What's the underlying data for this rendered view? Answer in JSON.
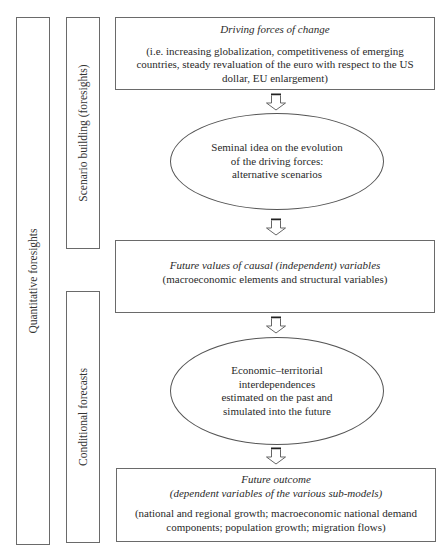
{
  "sections": {
    "outer": {
      "label": "Quantitative foresights"
    },
    "scenario": {
      "label": "Scenario building (foresights)"
    },
    "conditional": {
      "label": "Conditional forecasts"
    }
  },
  "nodes": {
    "driving_forces": {
      "title": "Driving forces of change",
      "body_lines": [
        "(i.e. increasing globalization, competitiveness of emerging",
        "countries, steady revaluation of the euro with respect to the US",
        "dollar, EU enlargement)"
      ]
    },
    "seminal_idea": {
      "lines": [
        "Seminal idea on the evolution",
        "of the driving forces:",
        "alternative scenarios"
      ]
    },
    "future_values": {
      "title": "Future values of causal (independent) variables",
      "body": "(macroeconomic elements and structural variables)"
    },
    "interdependences": {
      "lines": [
        "Economic–territorial",
        "interdependences",
        "estimated on the past and",
        "simulated into the future"
      ]
    },
    "future_outcome": {
      "title": "Future outcome",
      "subtitle": "(dependent variables of the various sub-models)",
      "body_lines": [
        "(national and regional growth; macroeconomic national demand",
        "components; population growth; migration flows)"
      ]
    }
  },
  "arrows": [
    {
      "from": "driving_forces",
      "to": "seminal_idea"
    },
    {
      "from": "seminal_idea",
      "to": "future_values"
    },
    {
      "from": "future_values",
      "to": "interdependences"
    },
    {
      "from": "interdependences",
      "to": "future_outcome"
    }
  ]
}
